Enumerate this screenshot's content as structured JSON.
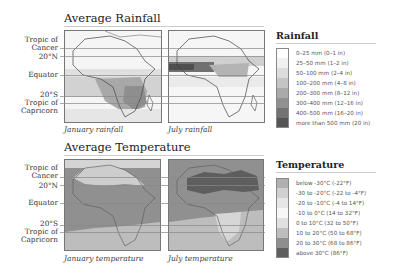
{
  "rainfall": {
    "title": "Average Rainfall",
    "captions": [
      "January rainfall",
      "July rainfall"
    ],
    "legend_title": "Rainfall",
    "legend": [
      {
        "label": "0–25 mm (0–1 in)",
        "color": "#ffffff"
      },
      {
        "label": "25–50 mm (1–2 in)",
        "color": "#f0f0f0"
      },
      {
        "label": "50–100 mm (2–4 in)",
        "color": "#dcdcdc"
      },
      {
        "label": "100–200 mm (4–8 in)",
        "color": "#c4c4c4"
      },
      {
        "label": "200–300 mm (8–12 in)",
        "color": "#aaaaaa"
      },
      {
        "label": "300–400 mm (12–16 in)",
        "color": "#909090"
      },
      {
        "label": "400–500 mm (16–20 in)",
        "color": "#737373"
      },
      {
        "label": "more than 500 mm (20 in)",
        "color": "#555555"
      }
    ]
  },
  "temperature": {
    "title": "Average Temperature",
    "captions": [
      "January temperature",
      "July temperature"
    ],
    "legend_title": "Temperature",
    "legend": [
      {
        "label": "below -30°C (-22°F)",
        "color": "#b0b0b0"
      },
      {
        "label": "-30 to -20°C (-22 to -4°F)",
        "color": "#d0d0d0"
      },
      {
        "label": "-20 to -10°C (-4 to 14°F)",
        "color": "#e6e6e6"
      },
      {
        "label": "-10 to 0°C (14 to 32°F)",
        "color": "#f7f7f7"
      },
      {
        "label": "0 to 10°C (32 to 50°F)",
        "color": "#e0e0e0"
      },
      {
        "label": "10 to 20°C (50 to 68°F)",
        "color": "#bdbdbd"
      },
      {
        "label": "20 to 30°C (68 to 86°F)",
        "color": "#8e8e8e"
      },
      {
        "label": "above 30°C (86°F)",
        "color": "#5e5e5e"
      }
    ]
  },
  "latitude_labels": {
    "cancer": [
      "Tropic of",
      "Cancer"
    ],
    "n20": "20°N",
    "equator": "Equator",
    "s20": "20°S",
    "capricorn": [
      "Tropic of",
      "Capricorn"
    ]
  }
}
